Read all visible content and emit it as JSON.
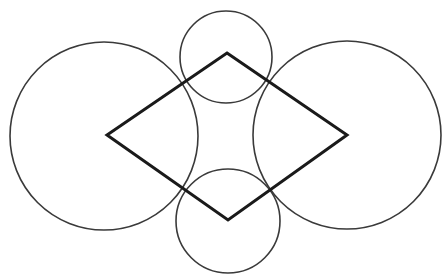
{
  "diagram": {
    "colors": {
      "background": "#ffffff",
      "circle_stroke": "#3a3a3a",
      "rhombus_stroke": "#1a1a1a"
    },
    "rhombus": {
      "vertices": [
        {
          "name": "top",
          "x": 227,
          "y": 53
        },
        {
          "name": "right",
          "x": 347,
          "y": 135
        },
        {
          "name": "bottom",
          "x": 228,
          "y": 220
        },
        {
          "name": "left",
          "x": 107,
          "y": 135
        }
      ],
      "stroke_width": 3
    },
    "circles": [
      {
        "name": "top",
        "cx": 226,
        "cy": 57,
        "r": 46
      },
      {
        "name": "right",
        "cx": 347,
        "cy": 135,
        "r": 94
      },
      {
        "name": "bottom",
        "cx": 228,
        "cy": 221,
        "r": 52
      },
      {
        "name": "left",
        "cx": 104,
        "cy": 136,
        "r": 94
      }
    ],
    "circle_stroke_width": 1.6
  }
}
